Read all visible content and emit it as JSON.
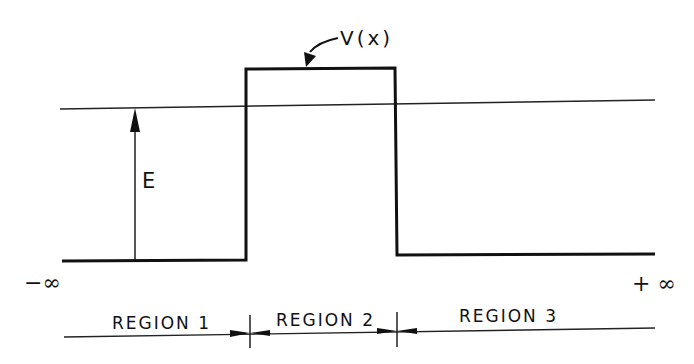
{
  "diagram": {
    "type": "potential-barrier",
    "potential_label": "V(x)",
    "energy_label": "E",
    "left_limit": "−∞",
    "right_limit": "+ ∞",
    "regions": [
      {
        "label": "REGION 1"
      },
      {
        "label": "REGION 2"
      },
      {
        "label": "REGION 3"
      }
    ],
    "colors": {
      "line": "#111111",
      "background": "#ffffff"
    }
  }
}
